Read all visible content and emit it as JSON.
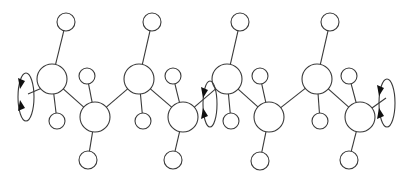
{
  "diagram": {
    "type": "zigzag polymer chain with side groups and rotation arrows",
    "colors": {
      "line": "#3a3a3a",
      "arrow": "#111111",
      "background": "#ffffff"
    },
    "backbone_atoms": [
      {
        "id": "b1",
        "x": 52,
        "y": 79,
        "r": 15
      },
      {
        "id": "b2",
        "x": 95,
        "y": 117,
        "r": 15
      },
      {
        "id": "b3",
        "x": 139,
        "y": 79,
        "r": 15
      },
      {
        "id": "b4",
        "x": 183,
        "y": 117,
        "r": 15
      },
      {
        "id": "b5",
        "x": 227,
        "y": 79,
        "r": 15
      },
      {
        "id": "b6",
        "x": 269,
        "y": 117,
        "r": 15
      },
      {
        "id": "b7",
        "x": 317,
        "y": 79,
        "r": 15
      },
      {
        "id": "b8",
        "x": 360,
        "y": 117,
        "r": 15
      }
    ],
    "side_atoms": [
      {
        "id": "s1a",
        "parent": "b1",
        "x": 66,
        "y": 22,
        "r": 9
      },
      {
        "id": "s1b",
        "parent": "b1",
        "x": 57,
        "y": 121,
        "r": 8
      },
      {
        "id": "s2a",
        "parent": "b2",
        "x": 87,
        "y": 76,
        "r": 8
      },
      {
        "id": "s2b",
        "parent": "b2",
        "x": 88,
        "y": 160,
        "r": 9
      },
      {
        "id": "s3a",
        "parent": "b3",
        "x": 152,
        "y": 22,
        "r": 9
      },
      {
        "id": "s3b",
        "parent": "b3",
        "x": 143,
        "y": 121,
        "r": 8
      },
      {
        "id": "s4a",
        "parent": "b4",
        "x": 173,
        "y": 76,
        "r": 8
      },
      {
        "id": "s4b",
        "parent": "b4",
        "x": 173,
        "y": 160,
        "r": 9
      },
      {
        "id": "s5a",
        "parent": "b5",
        "x": 240,
        "y": 22,
        "r": 9
      },
      {
        "id": "s5b",
        "parent": "b5",
        "x": 231,
        "y": 121,
        "r": 8
      },
      {
        "id": "s6a",
        "parent": "b6",
        "x": 260,
        "y": 76,
        "r": 8
      },
      {
        "id": "s6b",
        "parent": "b6",
        "x": 260,
        "y": 161,
        "r": 9
      },
      {
        "id": "s7a",
        "parent": "b7",
        "x": 330,
        "y": 22,
        "r": 9
      },
      {
        "id": "s7b",
        "parent": "b7",
        "x": 320,
        "y": 121,
        "r": 8
      },
      {
        "id": "s8a",
        "parent": "b8",
        "x": 349,
        "y": 76,
        "r": 8
      },
      {
        "id": "s8b",
        "parent": "b8",
        "x": 349,
        "y": 160,
        "r": 9
      }
    ],
    "terminal_bonds": [
      {
        "x1": 28,
        "y1": 94,
        "x2": 42,
        "y2": 88
      },
      {
        "x1": 372,
        "y1": 108,
        "x2": 386,
        "y2": 98
      }
    ],
    "rotation_loops": [
      {
        "id": "loop-left",
        "cx": 26,
        "cy": 97,
        "rx": 8,
        "ry": 24,
        "arrows": [
          {
            "x": 21,
            "y": 84,
            "dir": "down"
          },
          {
            "x": 21,
            "y": 105,
            "dir": "up"
          }
        ]
      },
      {
        "id": "loop-middle",
        "cx": 210,
        "cy": 104,
        "rx": 7,
        "ry": 23,
        "arrows": [
          {
            "x": 204,
            "y": 93,
            "dir": "down"
          },
          {
            "x": 204,
            "y": 113,
            "dir": "up"
          }
        ]
      },
      {
        "id": "loop-right",
        "cx": 387,
        "cy": 103,
        "rx": 8,
        "ry": 24,
        "arrows": [
          {
            "x": 380,
            "y": 91,
            "dir": "down"
          },
          {
            "x": 380,
            "y": 113,
            "dir": "up"
          }
        ]
      }
    ]
  }
}
